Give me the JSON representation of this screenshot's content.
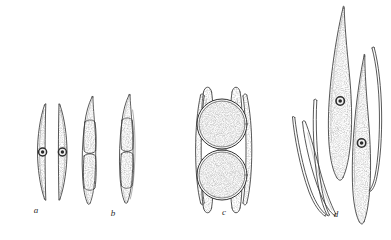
{
  "plate": {
    "title": "Conjugation and zygospore formation stages",
    "background_color": "#ffffff",
    "ink_color": "#3a3a3a",
    "stipple_color": "#6f6f6f",
    "width": 391,
    "height": 240
  },
  "figures": [
    {
      "label": "a",
      "label_x": 36,
      "label_y": 210,
      "description": "Two paired elongated spindle-shaped cells, each with a central ringed nucleus, apposed along flat inner faces",
      "cell_count": 2,
      "nuclei_visible": 2,
      "stippled": true
    },
    {
      "label": "b",
      "label_x": 113,
      "label_y": 213,
      "description": "Two elongate cells each divided into a clear apical cap, two stippled median compartments and a clear basal cap",
      "cell_count": 2,
      "nuclei_visible": 0,
      "stippled": true
    },
    {
      "label": "c",
      "label_x": 224,
      "label_y": 212,
      "description": "Two spherical zygospores with double-contoured walls enclosed within the empty parent cell-wall envelope",
      "cell_count": 2,
      "zygospores": 2,
      "stippled": true
    },
    {
      "label": "d",
      "label_x": 336,
      "label_y": 214,
      "description": "Two stippled spindle cells each with a ringed nucleus emerging from discarded empty cell-wall halves",
      "cell_count": 2,
      "nuclei_visible": 2,
      "empty_walls": 4,
      "stippled": true
    }
  ]
}
